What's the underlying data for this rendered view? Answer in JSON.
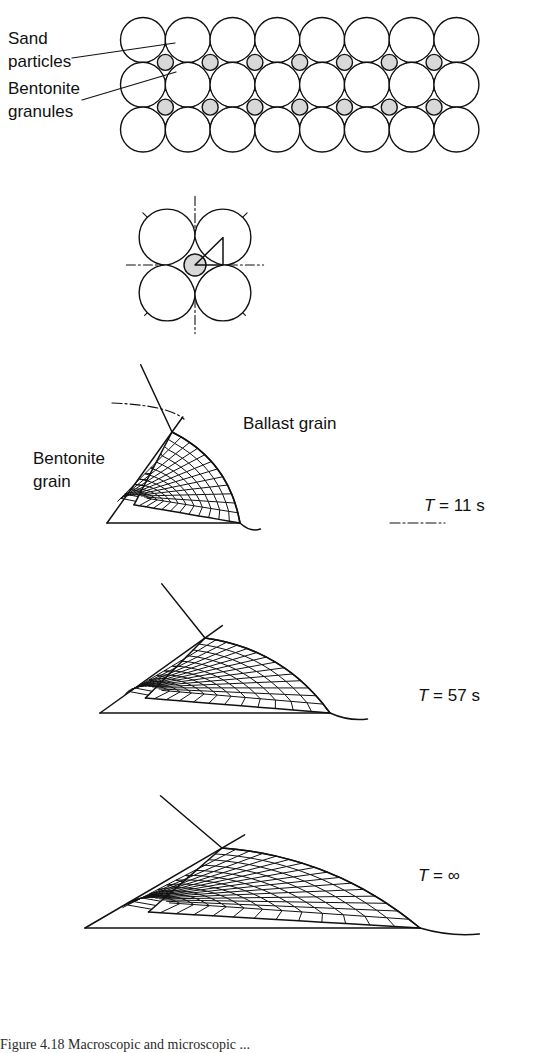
{
  "figure": {
    "caption": "Figure 4.18 Macroscopic and microscopic ...",
    "background_color": "#ffffff",
    "line_color": "#111111",
    "granule_fill": "#d8d8d8"
  },
  "labels": {
    "sand_particles": "Sand\nparticles",
    "sand_particles_line1": "Sand",
    "sand_particles_line2": "particles",
    "bentonite_granules_line1": "Bentonite",
    "bentonite_granules_line2": "granules",
    "bentonite_grain_line1": "Bentonite",
    "bentonite_grain_line2": "grain",
    "ballast_grain": "Ballast grain"
  },
  "panels": [
    {
      "id": "packing-array",
      "kind": "circle-packing",
      "rows": 3,
      "columns": 8,
      "grain_radius": 22.5,
      "granule_radius": 8.0,
      "origin_x": 143,
      "origin_y": 40,
      "granule_rows": 2,
      "granule_columns": 7
    },
    {
      "id": "unit-cell",
      "kind": "unit-cell",
      "center_x": 195,
      "center_y": 265,
      "grain_radius": 28,
      "granule_radius": 11,
      "symmetry_lines": [
        "vertical",
        "horizontal",
        "diagonal-up",
        "diagonal-down"
      ],
      "wedge_highlight": true
    },
    {
      "id": "mesh-11s",
      "kind": "fe-mesh",
      "time_label_prefix": "T",
      "time_label_equals": "=",
      "time_label_value": "11 s",
      "spread": 0.34,
      "origin_x": 107,
      "origin_y": 523,
      "apex_x": 172,
      "apex_y": 432,
      "tip_x": 240,
      "tip_y": 523,
      "radial_divisions": 12,
      "circumferential_divisions": 12,
      "label_x": 424,
      "label_y": 507,
      "show_grain_labels": true,
      "show_dashdot": true
    },
    {
      "id": "mesh-57s",
      "kind": "fe-mesh",
      "time_label_prefix": "T",
      "time_label_equals": "=",
      "time_label_value": "57 s",
      "spread": 0.62,
      "origin_x": 100,
      "origin_y": 713,
      "apex_x": 205,
      "apex_y": 638,
      "tip_x": 330,
      "tip_y": 713,
      "radial_divisions": 12,
      "circumferential_divisions": 14,
      "label_x": 418,
      "label_y": 697,
      "show_grain_labels": false,
      "show_dashdot": false
    },
    {
      "id": "mesh-inf",
      "kind": "fe-mesh",
      "time_label_prefix": "T",
      "time_label_equals": "=",
      "time_label_value": "∞",
      "spread": 1.0,
      "origin_x": 85,
      "origin_y": 928,
      "apex_x": 222,
      "apex_y": 848,
      "tip_x": 420,
      "tip_y": 928,
      "radial_divisions": 13,
      "circumferential_divisions": 16,
      "label_x": 418,
      "label_y": 877,
      "show_grain_labels": false,
      "show_dashdot": false
    }
  ],
  "leader_lines": [
    {
      "name": "sand-leader",
      "x1": 72,
      "y1": 58,
      "x2": 175,
      "y2": 43
    },
    {
      "name": "bentonite-leader",
      "x1": 82,
      "y1": 100,
      "x2": 176,
      "y2": 72
    }
  ]
}
